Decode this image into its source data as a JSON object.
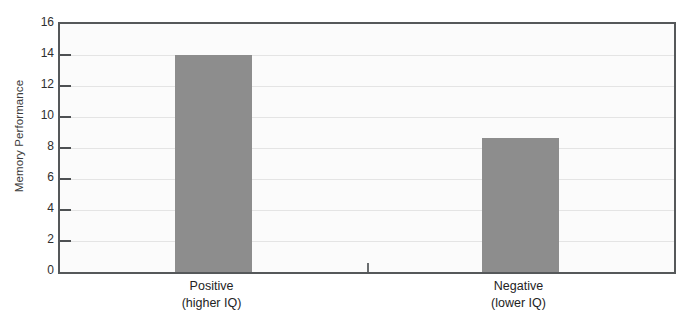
{
  "chart_data": {
    "type": "bar",
    "title": "",
    "subtitle": "",
    "xlabel": "",
    "ylabel": "Memory Performance",
    "categories": [
      "Positive\n(higher IQ)",
      "Negative\n(lower IQ)"
    ],
    "category_lines": [
      {
        "line1": "Positive",
        "line2": "(higher IQ)"
      },
      {
        "line1": "Negative",
        "line2": "(lower IQ)"
      }
    ],
    "values": [
      14.0,
      8.65
    ],
    "ylim": [
      0,
      16
    ],
    "ytick_step": 2,
    "yticks": [
      0,
      2,
      4,
      6,
      8,
      10,
      12,
      14,
      16
    ],
    "ytick_labels": [
      "0",
      "2",
      "4",
      "6",
      "8",
      "10",
      "12",
      "14",
      "16"
    ],
    "grid": true,
    "grid_axis": "y",
    "legend": false,
    "legend_position": "none",
    "annotations": []
  },
  "style": {
    "bar_color": "#8d8d8d",
    "plot_background": "#fbfbfb",
    "figure_background": "#ffffff",
    "gridline_color": "#e4e4e4",
    "axis_frame_color": "#55585a",
    "tick_color": "#4d5052",
    "text_color": "#232323"
  }
}
